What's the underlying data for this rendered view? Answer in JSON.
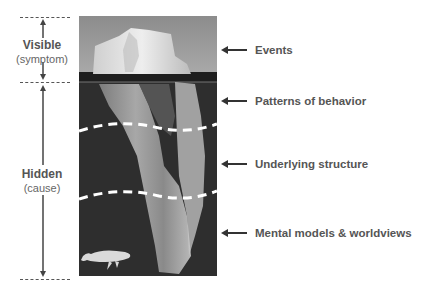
{
  "left_scale": {
    "visible": {
      "title": "Visible",
      "subtitle": "(symptom)"
    },
    "hidden": {
      "title": "Hidden",
      "subtitle": "(cause)"
    }
  },
  "levels": [
    {
      "label": "Events"
    },
    {
      "label": "Patterns of behavior"
    },
    {
      "label": "Underlying structure"
    },
    {
      "label": "Mental models & worldviews"
    }
  ],
  "colors": {
    "sky": "#9a9a9a",
    "water": "#2e2e2e",
    "ice": "#d8d8d8",
    "text": "#555555",
    "dash": "#ffffff"
  }
}
